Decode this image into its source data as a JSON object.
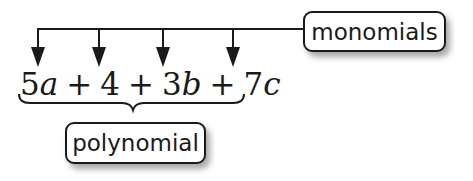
{
  "diagram": {
    "type": "annotated-expression",
    "expression": {
      "terms": [
        {
          "coef": "5",
          "var": "a"
        },
        {
          "coef": "4",
          "var": ""
        },
        {
          "coef": "3",
          "var": "b"
        },
        {
          "coef": "7",
          "var": "c"
        }
      ],
      "operators": [
        "+",
        "+",
        "+"
      ]
    },
    "labels": {
      "monomials": "monomials",
      "polynomial": "polynomial"
    },
    "colors": {
      "stroke": "#1a1a1a",
      "background": "#ffffff",
      "shadow": "#8c8c8c"
    },
    "connections": [
      {
        "from": "monomials",
        "to": "term-5a",
        "kind": "arrow"
      },
      {
        "from": "monomials",
        "to": "term-4",
        "kind": "arrow"
      },
      {
        "from": "monomials",
        "to": "term-3b",
        "kind": "arrow"
      },
      {
        "from": "monomials",
        "to": "term-7c",
        "kind": "arrow"
      },
      {
        "from": "expression",
        "to": "polynomial",
        "kind": "brace"
      }
    ]
  }
}
